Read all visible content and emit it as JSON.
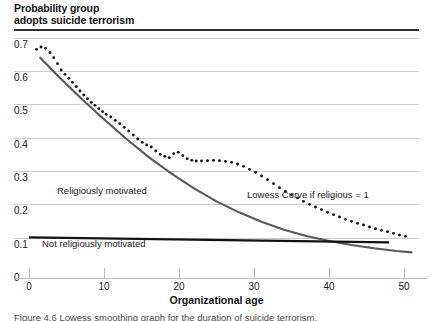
{
  "figure": {
    "y_axis_title_line1": "Probability group",
    "y_axis_title_line2": "adopts suicide terrorism",
    "x_axis_title": "Organizational age",
    "caption": "Figure 4.6 Lowess smoothing graph for the duration of suicide terrorism."
  },
  "annotations": {
    "religious": "Religiously motivated",
    "not_religious": "Not religiously motivated",
    "lowess": "Lowess Curve if religious = 1"
  },
  "colors": {
    "gridline": "#c9ccd1",
    "top_rule": "#2b2b33",
    "axis": "#b9bcc1",
    "religious_curve": "#555a61",
    "not_religious_line": "#111111",
    "dotted_curve": "#111111",
    "text": "#1a1a1a"
  },
  "chart_data": {
    "type": "line",
    "title": "Probability group adopts suicide terrorism",
    "xlabel": "Organizational age",
    "ylabel": "Probability group adopts suicide terrorism",
    "xlim": [
      -2,
      52
    ],
    "ylim": [
      0.0,
      0.72
    ],
    "xticks": [
      0,
      10,
      20,
      30,
      40,
      50
    ],
    "yticks": [
      0,
      0.1,
      0.2,
      0.3,
      0.4,
      0.5,
      0.6,
      0.7
    ],
    "ytick_labels": [
      "0",
      "0.1",
      "0.2",
      "0.3",
      "0.4",
      "0.5",
      "0.6",
      "0.7"
    ],
    "xtick_labels": [
      "0",
      "10",
      "20",
      "30",
      "40",
      "50"
    ],
    "grid": "horizontal",
    "legend": "inline-annotations",
    "series": [
      {
        "name": "Lowess Curve if religious = 1",
        "style": "dotted",
        "color": "#111111",
        "x": [
          1.0,
          1.6,
          2.2,
          2.8,
          3.3,
          3.8,
          4.3,
          4.8,
          5.3,
          5.8,
          6.3,
          6.8,
          7.3,
          7.8,
          8.3,
          8.8,
          9.3,
          9.8,
          10.3,
          10.9,
          11.5,
          12.1,
          12.7,
          13.3,
          13.9,
          14.5,
          15.1,
          15.7,
          16.3,
          16.9,
          17.5,
          18.1,
          18.7,
          19.3,
          19.9,
          20.5,
          21.1,
          21.7,
          22.3,
          23.0,
          23.8,
          24.6,
          25.4,
          26.2,
          27.0,
          27.8,
          28.6,
          29.4,
          30.2,
          31.0,
          31.8,
          32.6,
          33.4,
          34.2,
          35.0,
          35.8,
          36.6,
          37.4,
          38.2,
          39.0,
          39.8,
          40.6,
          41.4,
          42.2,
          43.0,
          43.8,
          44.6,
          45.4,
          46.2,
          47.0,
          47.8,
          48.6,
          49.4,
          50.2
        ],
        "y": [
          0.665,
          0.672,
          0.668,
          0.655,
          0.64,
          0.622,
          0.603,
          0.59,
          0.578,
          0.566,
          0.553,
          0.54,
          0.528,
          0.517,
          0.506,
          0.497,
          0.487,
          0.478,
          0.47,
          0.462,
          0.452,
          0.442,
          0.431,
          0.42,
          0.408,
          0.396,
          0.386,
          0.378,
          0.372,
          0.36,
          0.35,
          0.344,
          0.34,
          0.352,
          0.356,
          0.346,
          0.337,
          0.332,
          0.33,
          0.33,
          0.331,
          0.332,
          0.331,
          0.329,
          0.326,
          0.321,
          0.314,
          0.305,
          0.296,
          0.285,
          0.274,
          0.262,
          0.25,
          0.239,
          0.229,
          0.219,
          0.209,
          0.2,
          0.192,
          0.184,
          0.176,
          0.169,
          0.162,
          0.155,
          0.149,
          0.143,
          0.138,
          0.132,
          0.127,
          0.122,
          0.118,
          0.113,
          0.108,
          0.104
        ]
      },
      {
        "name": "Religiously motivated",
        "style": "solid",
        "color": "#555a61",
        "x": [
          1.5,
          4,
          7,
          10,
          13,
          16,
          19,
          22,
          25,
          28,
          31,
          34,
          37,
          40,
          43,
          46,
          49,
          51
        ],
        "y": [
          0.64,
          0.582,
          0.517,
          0.455,
          0.396,
          0.341,
          0.292,
          0.248,
          0.209,
          0.176,
          0.148,
          0.124,
          0.105,
          0.09,
          0.078,
          0.068,
          0.06,
          0.056
        ]
      },
      {
        "name": "Not religiously motivated",
        "style": "solid",
        "color": "#111111",
        "x": [
          0,
          48
        ],
        "y": [
          0.101,
          0.086
        ]
      }
    ]
  }
}
